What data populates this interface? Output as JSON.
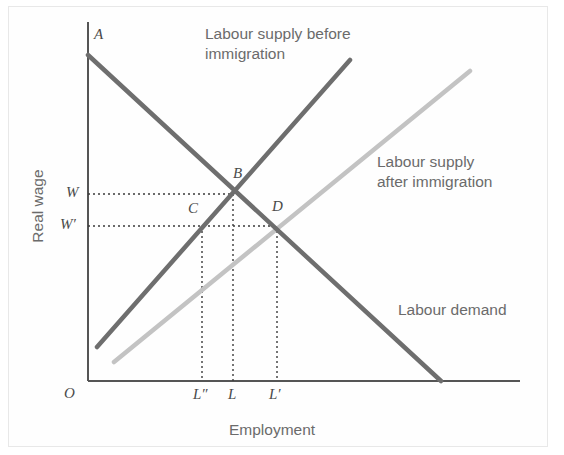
{
  "figure": {
    "width": 564,
    "height": 455,
    "background": "#ffffff",
    "border_color": "#e8e8e8"
  },
  "axes": {
    "y_axis_label": "Real wage",
    "x_axis_label": "Employment",
    "origin_label": "O",
    "x_ticks": [
      {
        "label": "L″",
        "x": 202
      },
      {
        "label": "L",
        "x": 233
      },
      {
        "label": "L′",
        "x": 277
      }
    ],
    "y_ticks": [
      {
        "label": "W",
        "y": 194
      },
      {
        "label": "W′",
        "y": 226
      }
    ],
    "axis_color": "#555555",
    "origin_px": {
      "x": 88,
      "y": 381
    },
    "x_axis_end_px": 520,
    "y_axis_top_px": 22
  },
  "curves": [
    {
      "name": "labour-demand",
      "label": "Labour demand",
      "color": "#6e6e6e",
      "width": 4.5,
      "x1": 88,
      "y1": 55,
      "x2": 441,
      "y2": 381,
      "label_x": 398,
      "label_y": 300
    },
    {
      "name": "labour-supply-before",
      "label": "Labour supply before\nimmigration",
      "color": "#6e6e6e",
      "width": 4.5,
      "x1": 97,
      "y1": 347,
      "x2": 350,
      "y2": 60,
      "label_x": 205,
      "label_y": 24
    },
    {
      "name": "labour-supply-after",
      "label": "Labour supply\nafter immigration",
      "color": "#c3c3c3",
      "width": 4.5,
      "x1": 114,
      "y1": 362,
      "x2": 470,
      "y2": 71,
      "label_x": 377,
      "label_y": 152
    }
  ],
  "points": [
    {
      "name": "point-a",
      "label": "A",
      "x": 88,
      "y": 55,
      "label_x": 94,
      "label_y": 26
    },
    {
      "name": "point-b",
      "label": "B",
      "x": 232,
      "y": 194,
      "label_x": 233,
      "label_y": 165
    },
    {
      "name": "point-c",
      "label": "C",
      "x": 202,
      "y": 226,
      "label_x": 188,
      "label_y": 200
    },
    {
      "name": "point-d",
      "label": "D",
      "x": 277,
      "y": 226,
      "label_x": 272,
      "label_y": 198
    }
  ],
  "guides": {
    "color": "#3a3a3a",
    "dash": "2,3",
    "horizontal": [
      {
        "name": "guide-w",
        "y": 194,
        "x_from": 88,
        "x_to": 232
      },
      {
        "name": "guide-w-prime",
        "y": 226,
        "x_from": 88,
        "x_to": 277
      }
    ],
    "vertical": [
      {
        "name": "guide-l-double-prime",
        "x": 202,
        "y_from": 226,
        "y_to": 381
      },
      {
        "name": "guide-l",
        "x": 233,
        "y_from": 194,
        "y_to": 381
      },
      {
        "name": "guide-l-prime",
        "x": 277,
        "y_from": 226,
        "y_to": 381
      }
    ]
  }
}
